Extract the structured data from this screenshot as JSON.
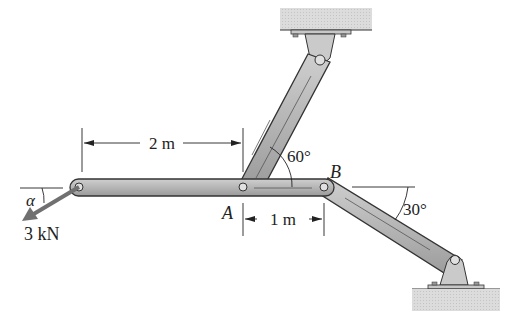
{
  "figure": {
    "type": "statics-truss-diagram",
    "labels": {
      "point_a": "A",
      "point_b": "B",
      "dim_2m": "2 m",
      "dim_1m": "1 m",
      "angle_60": "60°",
      "angle_30": "30°",
      "angle_alpha": "α",
      "force": "3 kN"
    },
    "colors": {
      "member_fill": "#b8b8b8",
      "member_stroke": "#333333",
      "ground_fill": "#d9d9d9",
      "bracket_fill": "#c8c8c8",
      "line": "#222222",
      "force_arrow": "#707070"
    }
  }
}
